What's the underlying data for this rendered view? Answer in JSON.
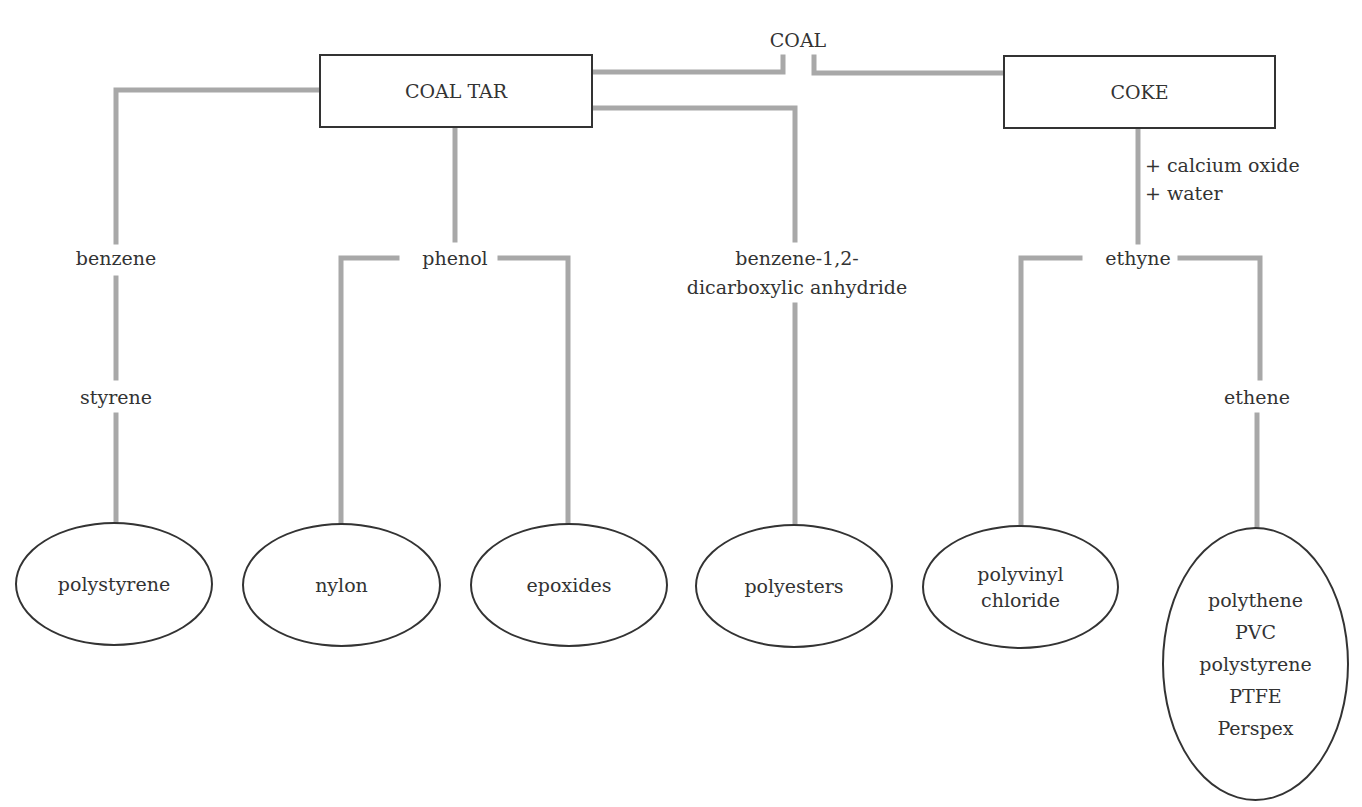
{
  "diagram": {
    "title_partial": "Polymers manufactured from coal — original figure title cropped at the top (only descenders visible)",
    "source": {
      "label": "COAL"
    },
    "intermediates": {
      "coal_tar": {
        "label": "COAL TAR"
      },
      "coke": {
        "label": "COKE"
      }
    },
    "reagent_note": {
      "line1": "+ calcium oxide",
      "line2": "+ water"
    },
    "chemicals": {
      "benzene": "benzene",
      "styrene": "styrene",
      "phenol": "phenol",
      "anhydride_line1": "benzene-1,2-",
      "anhydride_line2": "dicarboxylic anhydride",
      "ethyne": "ethyne",
      "ethene": "ethene"
    },
    "products": {
      "polystyrene": {
        "lines": [
          "polystyrene"
        ]
      },
      "nylon": {
        "lines": [
          "nylon"
        ]
      },
      "epoxides": {
        "lines": [
          "epoxides"
        ]
      },
      "polyesters": {
        "lines": [
          "polyesters"
        ]
      },
      "pvc": {
        "lines": [
          "polyvinyl",
          "chloride"
        ]
      },
      "ethene_products": {
        "lines": [
          "polythene",
          "PVC",
          "polystyrene",
          "PTFE",
          "Perspex"
        ]
      }
    },
    "colors": {
      "connector": "#a8a8a8",
      "outline": "#333333",
      "text": "#333333",
      "background": "#ffffff"
    }
  }
}
